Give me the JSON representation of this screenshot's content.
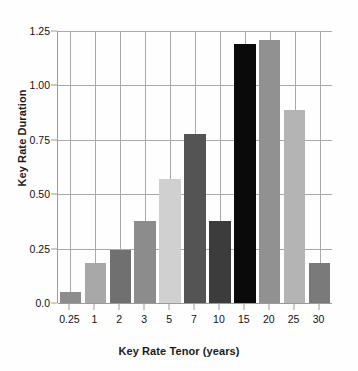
{
  "chart_data": {
    "type": "bar",
    "title": "",
    "xlabel": "Key Rate Tenor (years)",
    "ylabel": "Key Rate Duration",
    "categories": [
      "0.25",
      "1",
      "2",
      "3",
      "5",
      "7",
      "10",
      "15",
      "20",
      "25",
      "30"
    ],
    "values": [
      0.05,
      0.185,
      0.245,
      0.375,
      0.57,
      0.775,
      0.375,
      1.19,
      1.21,
      0.885,
      0.185
    ],
    "bar_colors": [
      "#8c8c8c",
      "#a8a8a8",
      "#707070",
      "#8c8c8c",
      "#d0d0d0",
      "#545454",
      "#3c3c3c",
      "#0a0a0a",
      "#919191",
      "#b4b4b4",
      "#7a7a7a"
    ],
    "ylim": [
      0.0,
      1.25
    ],
    "ytick_labels": [
      "0.0",
      "0.25",
      "0.50",
      "0.75",
      "1.00",
      "1.25"
    ],
    "ytick_values": [
      0.0,
      0.25,
      0.5,
      0.75,
      1.0,
      1.25
    ],
    "grid": true,
    "legend": "none",
    "axis_color": "#9a9a9a",
    "gridline_color": "#a9a9a9",
    "background": "#fefefe",
    "text_color": "#111111"
  }
}
